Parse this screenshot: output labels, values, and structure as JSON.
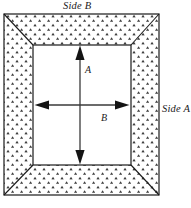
{
  "figure": {
    "title_top": "Side B",
    "title_right": "Side A",
    "dimension_vertical": "A",
    "dimension_horizontal": "B",
    "colors": {
      "stroke": "#1a1a1a",
      "hatch_mark": "#3a3a3a",
      "fill_inner": "#ffffff",
      "fill_border": "#ffffff",
      "background": "#ffffff"
    },
    "geometry": {
      "outer_rect": {
        "x": 4,
        "y": 14,
        "width": 155,
        "height": 181
      },
      "inner_rect": {
        "x": 33,
        "y": 45,
        "width": 98,
        "height": 120
      },
      "miter_corners": true,
      "border_pattern": "triangle-stipple"
    },
    "arrows": {
      "vertical": {
        "name": "A",
        "x": 80,
        "y_top": 47,
        "y_bottom": 164,
        "double_headed": true
      },
      "horizontal": {
        "name": "B",
        "y": 105,
        "x_left": 35,
        "x_right": 129,
        "double_headed": true
      }
    }
  }
}
